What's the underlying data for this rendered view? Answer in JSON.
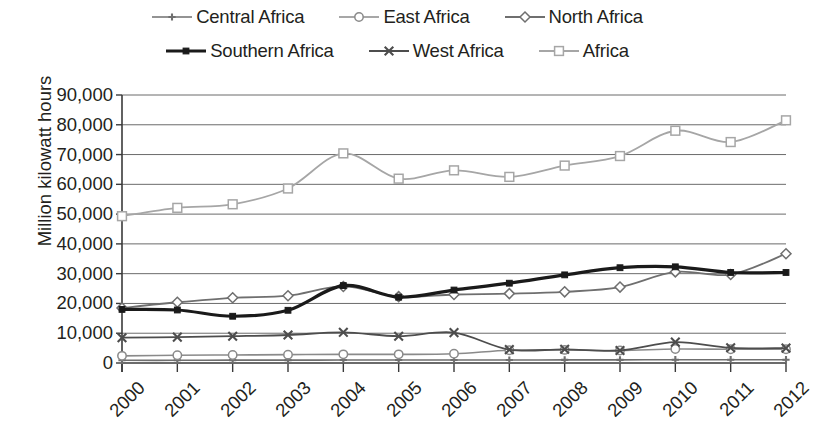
{
  "legend": {
    "rows": [
      [
        {
          "label": "Central Africa",
          "key": "plus-marker-line",
          "color": "#6f6f6f"
        },
        {
          "label": "East Africa",
          "key": "circle-marker-line",
          "color": "#8a8a8a"
        },
        {
          "label": "North Africa",
          "key": "diamond-marker-line",
          "color": "#6f6f6f"
        }
      ],
      [
        {
          "label": "Southern Africa",
          "key": "square-marker-thick-line",
          "color": "#1a1a1a"
        },
        {
          "label": "West Africa",
          "key": "x-marker-line",
          "color": "#4d4d4d"
        },
        {
          "label": "Africa",
          "key": "open-square-marker-line",
          "color": "#a6a6a6"
        }
      ]
    ]
  },
  "chart_data": {
    "type": "line",
    "title": "",
    "xlabel": "",
    "ylabel": "Million kilowatt hours",
    "x": [
      2000,
      2001,
      2002,
      2003,
      2004,
      2005,
      2006,
      2007,
      2008,
      2009,
      2010,
      2011,
      2012
    ],
    "xtick_labels": [
      "2000",
      "2001",
      "2002",
      "2003",
      "2004",
      "2005",
      "2006",
      "2007",
      "2008",
      "2009",
      "2010",
      "2011",
      "2012"
    ],
    "ytick_labels": [
      "0",
      "10,000",
      "20,000",
      "30,000",
      "40,000",
      "50,000",
      "60,000",
      "70,000",
      "80,000",
      "90,000"
    ],
    "ytick_values": [
      0,
      10000,
      20000,
      30000,
      40000,
      50000,
      60000,
      70000,
      80000,
      90000
    ],
    "ylim": [
      0,
      90000
    ],
    "grid": true,
    "legend_position": "top",
    "series": [
      {
        "name": "Central Africa",
        "color": "#6f6f6f",
        "marker": "plus",
        "width": 1.6,
        "values": [
          900,
          900,
          950,
          950,
          1000,
          1000,
          1000,
          1000,
          1050,
          1050,
          1100,
          1100,
          1100
        ]
      },
      {
        "name": "East Africa",
        "color": "#8a8a8a",
        "marker": "circle",
        "width": 1.6,
        "values": [
          2400,
          2600,
          2700,
          2800,
          2900,
          2900,
          3100,
          4300,
          4400,
          4200,
          4700,
          4600,
          4600
        ]
      },
      {
        "name": "North Africa",
        "color": "#6f6f6f",
        "marker": "diamond",
        "width": 1.8,
        "values": [
          18500,
          20400,
          21900,
          22600,
          25700,
          22300,
          23000,
          23300,
          23900,
          25500,
          30600,
          29700,
          36700
        ]
      },
      {
        "name": "Southern Africa",
        "color": "#1a1a1a",
        "marker": "square",
        "width": 3.2,
        "values": [
          18000,
          17800,
          15700,
          17700,
          26000,
          22100,
          24500,
          26800,
          29600,
          32000,
          32300,
          30400,
          30400
        ]
      },
      {
        "name": "West Africa",
        "color": "#4d4d4d",
        "marker": "x",
        "width": 1.8,
        "values": [
          8500,
          8700,
          9000,
          9400,
          10300,
          9000,
          10200,
          4500,
          4600,
          4200,
          7000,
          5100,
          5000
        ]
      },
      {
        "name": "Africa",
        "color": "#a6a6a6",
        "marker": "open-square",
        "width": 1.8,
        "values": [
          49300,
          52100,
          53300,
          58600,
          70400,
          61900,
          64700,
          62500,
          66300,
          69500,
          78000,
          74200,
          81500
        ]
      }
    ]
  }
}
